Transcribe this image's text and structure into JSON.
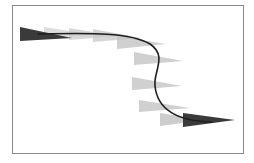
{
  "diagram": {
    "type": "motion-path",
    "frame": {
      "x": 12,
      "y": 5,
      "width": 232,
      "height": 149,
      "stroke": "#8a8a8a"
    },
    "path": {
      "d": "M 38 34 C 90 33, 130 32, 150 44 C 168 56, 153 72, 155 86 C 157 106, 172 121, 212 122",
      "stroke": "#1e1e1e",
      "width": 1.6
    },
    "wedges": [
      {
        "x": 20,
        "top": 27,
        "bottom": 41,
        "tip_x": 72,
        "tip_y": 38,
        "fill": "#3a3a3a",
        "opacity": 1.0,
        "role": "start"
      },
      {
        "x": 44,
        "top": 27,
        "bottom": 38,
        "tip_x": 96,
        "tip_y": 35,
        "fill": "#cfcfcf",
        "opacity": 0.7,
        "role": "ghost"
      },
      {
        "x": 69,
        "top": 28,
        "bottom": 40,
        "tip_x": 118,
        "tip_y": 36,
        "fill": "#c8c8c8",
        "opacity": 0.7,
        "role": "ghost"
      },
      {
        "x": 93,
        "top": 29,
        "bottom": 42,
        "tip_x": 141,
        "tip_y": 38,
        "fill": "#c8c8c8",
        "opacity": 0.75,
        "role": "ghost"
      },
      {
        "x": 117,
        "top": 36,
        "bottom": 49,
        "tip_x": 166,
        "tip_y": 44,
        "fill": "#c4c4c4",
        "opacity": 0.8,
        "role": "ghost"
      },
      {
        "x": 134,
        "top": 52,
        "bottom": 65,
        "tip_x": 183,
        "tip_y": 61,
        "fill": "#c4c4c4",
        "opacity": 0.8,
        "role": "ghost"
      },
      {
        "x": 132,
        "top": 77,
        "bottom": 90,
        "tip_x": 182,
        "tip_y": 86,
        "fill": "#c4c4c4",
        "opacity": 0.8,
        "role": "ghost"
      },
      {
        "x": 139,
        "top": 100,
        "bottom": 112,
        "tip_x": 190,
        "tip_y": 108,
        "fill": "#c4c4c4",
        "opacity": 0.8,
        "role": "ghost"
      },
      {
        "x": 160,
        "top": 113,
        "bottom": 126,
        "tip_x": 205,
        "tip_y": 120,
        "fill": "#c4c4c4",
        "opacity": 0.85,
        "role": "ghost"
      },
      {
        "x": 183,
        "top": 113,
        "bottom": 127,
        "tip_x": 235,
        "tip_y": 120,
        "fill": "#3a3a3a",
        "opacity": 1.0,
        "role": "end"
      }
    ]
  }
}
